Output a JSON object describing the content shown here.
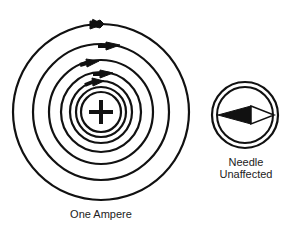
{
  "diagram": {
    "wire": {
      "symbol": "+",
      "meaning": "current flowing into/out of page"
    },
    "field_lines": {
      "count": 6,
      "direction": "clockwise",
      "arrows": 5
    },
    "compass": {
      "state": "Needle Unaffected"
    }
  },
  "labels": {
    "current": "One Ampere",
    "needle_line1": "Needle",
    "needle_line2": "Unaffected"
  },
  "colors": {
    "stroke": "#111111",
    "background": "#ffffff",
    "text": "#222222"
  }
}
